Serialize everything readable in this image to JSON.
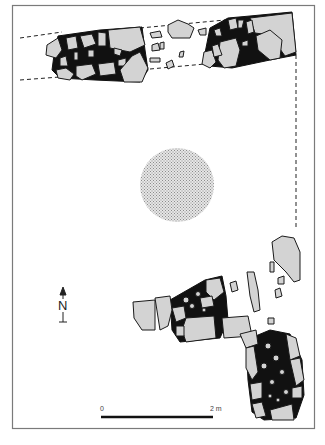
{
  "figure": {
    "type": "archaeological-site-plan",
    "colors": {
      "background": "#ffffff",
      "frame": "#7a7a7a",
      "stone_fill": "#d3d3d3",
      "stone_outline": "#1a1a1a",
      "mortar_fill": "#111111",
      "dashed_line": "#222222",
      "central_feature": "#bdbdbd"
    },
    "north_arrow": {
      "label": "N",
      "icon": "north-arrow-icon"
    },
    "scale_bar": {
      "start_label": "0",
      "end_label": "2 m"
    },
    "features": [
      {
        "id": "north-wall-west",
        "description": "stone wall segment with black mortar, top-left"
      },
      {
        "id": "north-wall-scatter",
        "description": "loose scattered stones between wall segments"
      },
      {
        "id": "north-wall-east",
        "description": "stone wall segment, top-right corner"
      },
      {
        "id": "central-pit",
        "description": "circular stippled feature in center"
      },
      {
        "id": "east-scatter",
        "description": "loose stones along east side"
      },
      {
        "id": "south-wall-west",
        "description": "stone wall segment, lower center"
      },
      {
        "id": "south-east-corner",
        "description": "stone wall corner, bottom-right"
      },
      {
        "id": "reconstructed-outline",
        "description": "dashed lines indicating projected walls"
      }
    ]
  }
}
